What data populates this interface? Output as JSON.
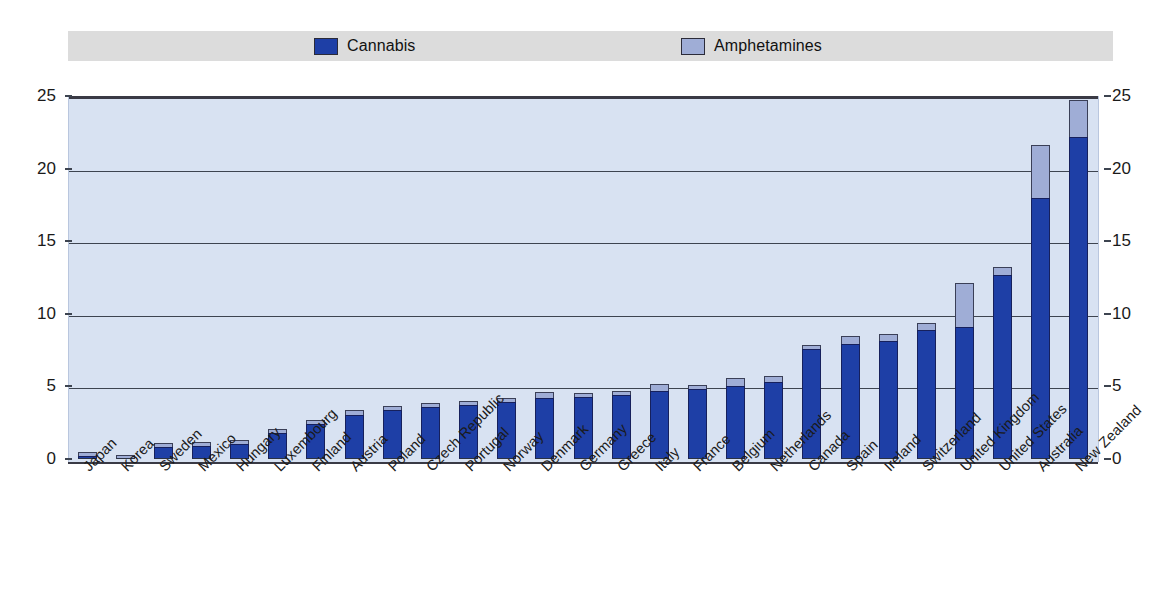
{
  "legend": {
    "position": "top",
    "items": [
      {
        "label": "Cannabis",
        "color": "#1e3fa6",
        "icon": "legend-swatch-cannabis"
      },
      {
        "label": "Amphetamines",
        "color": "#9fadd6",
        "icon": "legend-swatch-amphetamines"
      }
    ]
  },
  "axes": {
    "y_ticks": [
      "25",
      "20",
      "15",
      "10",
      "5",
      "0"
    ],
    "y_ticks_right": [
      "25",
      "20",
      "15",
      "10",
      "5",
      "0"
    ]
  },
  "chart_data": {
    "type": "bar",
    "stacked": true,
    "title": "",
    "subtitle": "",
    "xlabel": "",
    "ylabel": "",
    "ylim": [
      0,
      25
    ],
    "yticks": [
      0,
      5,
      10,
      15,
      20,
      25
    ],
    "grid": true,
    "legend_position": "top",
    "categories": [
      "Japan",
      "Korea",
      "Sweden",
      "Mexico",
      "Hungary",
      "Luxembourg",
      "Finland",
      "Austria",
      "Poland",
      "Czech Republic",
      "Portugal",
      "Norway",
      "Denmark",
      "Germany",
      "Greece",
      "Italy",
      "France",
      "Belgium",
      "Netherlands",
      "Canada",
      "Spain",
      "Ireland",
      "Switzerland",
      "United Kingdom",
      "United States",
      "Australia",
      "New Zealand"
    ],
    "series": [
      {
        "name": "Cannabis",
        "color": "#1e3fa6",
        "values": [
          0.1,
          0.0,
          0.8,
          0.9,
          1.0,
          1.8,
          2.4,
          3.0,
          3.4,
          3.6,
          3.7,
          3.9,
          4.2,
          4.3,
          4.4,
          4.7,
          4.8,
          5.0,
          5.3,
          7.6,
          7.9,
          8.1,
          8.9,
          9.1,
          12.7,
          18.0,
          22.2
        ]
      },
      {
        "name": "Amphetamines",
        "color": "#9fadd6",
        "values": [
          0.1,
          0.3,
          0.2,
          0.2,
          0.2,
          0.2,
          0.3,
          0.4,
          0.2,
          0.2,
          0.2,
          0.2,
          0.4,
          0.2,
          0.1,
          0.5,
          0.2,
          0.6,
          0.4,
          0.1,
          0.6,
          0.5,
          0.5,
          3.0,
          0.5,
          3.6,
          2.5
        ]
      }
    ],
    "totals": [
      0.2,
      0.3,
      1.0,
      1.1,
      1.2,
      2.0,
      2.7,
      3.4,
      3.6,
      3.8,
      3.9,
      4.1,
      4.6,
      4.5,
      4.5,
      5.2,
      5.0,
      5.6,
      5.7,
      7.7,
      8.5,
      8.6,
      9.4,
      12.1,
      13.2,
      21.6,
      24.7
    ]
  }
}
